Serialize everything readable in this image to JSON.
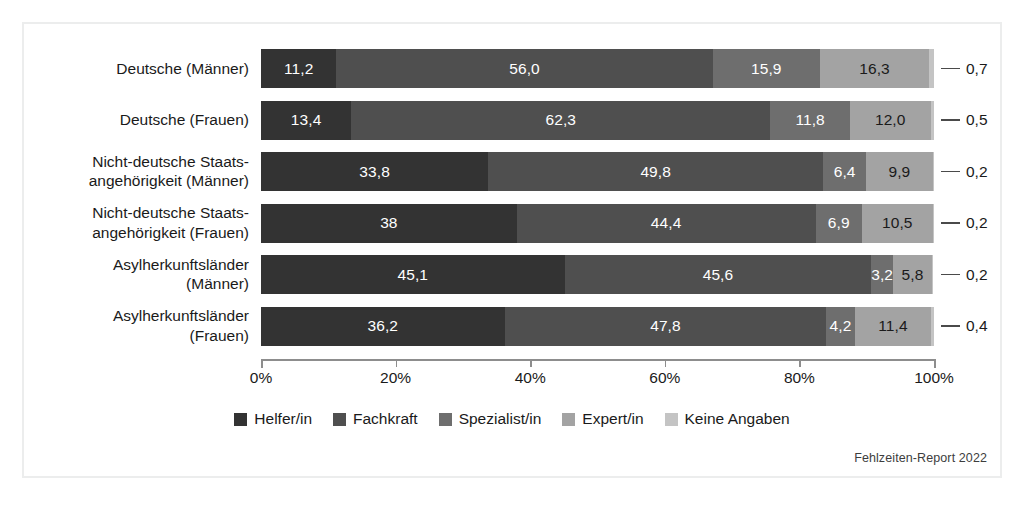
{
  "source_note": "Fehlzeiten-Report 2022",
  "chart_data": {
    "type": "bar",
    "orientation": "horizontal",
    "stacked": true,
    "stacked_percent": true,
    "title": "",
    "xlabel": "",
    "ylabel": "",
    "xlim": [
      0,
      100
    ],
    "xtick_labels": [
      "0%",
      "20%",
      "40%",
      "60%",
      "80%",
      "100%"
    ],
    "xtick_values": [
      0,
      20,
      40,
      60,
      80,
      100
    ],
    "grid": false,
    "legend_position": "bottom",
    "legend": [
      "Helfer/in",
      "Fachkraft",
      "Spezialist/in",
      "Expert/in",
      "Keine Angaben"
    ],
    "colors": [
      "#333333",
      "#4f4f4f",
      "#6e6e6e",
      "#a3a3a3",
      "#c4c4c4"
    ],
    "label_text_colors": [
      "#ffffff",
      "#ffffff",
      "#ffffff",
      "#1a1a1a",
      "#1a1a1a"
    ],
    "categories": [
      "Deutsche (Männer)",
      "Deutsche (Frauen)",
      "Nicht-deutsche Staats-\nangehörigkeit (Männer)",
      "Nicht-deutsche Staats-\nangehörigkeit (Frauen)",
      "Asylherkunftsländer\n(Männer)",
      "Asylherkunftsländer\n(Frauen)"
    ],
    "series": [
      {
        "name": "Helfer/in",
        "values": [
          11.2,
          13.4,
          33.8,
          38.0,
          45.1,
          36.2
        ]
      },
      {
        "name": "Fachkraft",
        "values": [
          56.0,
          62.3,
          49.8,
          44.4,
          45.6,
          47.8
        ]
      },
      {
        "name": "Spezialist/in",
        "values": [
          15.9,
          11.8,
          6.4,
          6.9,
          3.2,
          4.2
        ]
      },
      {
        "name": "Expert/in",
        "values": [
          16.3,
          12.0,
          9.9,
          10.5,
          5.8,
          11.4
        ]
      },
      {
        "name": "Keine Angaben",
        "values": [
          0.7,
          0.5,
          0.2,
          0.2,
          0.2,
          0.4
        ]
      }
    ],
    "bar_labels": [
      [
        "11,2",
        "56,0",
        "15,9",
        "16,3",
        ""
      ],
      [
        "13,4",
        "62,3",
        "11,8",
        "12,0",
        ""
      ],
      [
        "33,8",
        "49,8",
        "6,4",
        "9,9",
        ""
      ],
      [
        "38",
        "44,4",
        "6,9",
        "10,5",
        ""
      ],
      [
        "45,1",
        "45,6",
        "3,2",
        "5,8",
        ""
      ],
      [
        "36,2",
        "47,8",
        "4,2",
        "11,4",
        ""
      ]
    ],
    "callout_labels": [
      "0,7",
      "0,5",
      "0,2",
      "0,2",
      "0,2",
      "0,4"
    ],
    "callout_series": "Keine Angaben"
  }
}
